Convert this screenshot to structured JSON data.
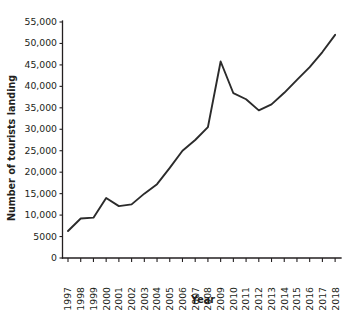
{
  "chart_data": {
    "type": "line",
    "title": "",
    "xlabel": "Year",
    "ylabel": "Number of tourists landing",
    "categories": [
      "1997",
      "1998",
      "1999",
      "2000",
      "2001",
      "2002",
      "2003",
      "2004",
      "2005",
      "2006",
      "2007",
      "2008",
      "2009",
      "2010",
      "2011",
      "2012",
      "2013",
      "2014",
      "2015",
      "2016",
      "2017",
      "2018"
    ],
    "values": [
      6300,
      9200,
      9400,
      14000,
      12100,
      12500,
      15000,
      17200,
      21000,
      25000,
      27500,
      30500,
      45800,
      38400,
      37000,
      34400,
      35800,
      38500,
      41500,
      44500,
      48000,
      52000
    ],
    "series": [
      {
        "name": "Number of tourists landing",
        "values": [
          6300,
          9200,
          9400,
          14000,
          12100,
          12500,
          15000,
          17200,
          21000,
          25000,
          27500,
          30500,
          45800,
          38400,
          37000,
          34400,
          35800,
          38500,
          41500,
          44500,
          48000,
          52000
        ]
      }
    ],
    "ylim": [
      0,
      55000
    ],
    "ytick_values": [
      0,
      5000,
      10000,
      15000,
      20000,
      25000,
      30000,
      35000,
      40000,
      45000,
      50000,
      55000
    ],
    "ytick_labels": [
      "0",
      "5000",
      "10,000",
      "15,000",
      "20,000",
      "25,000",
      "30,000",
      "35,000",
      "40,000",
      "45,000",
      "50,000",
      "55,000"
    ],
    "grid": false,
    "legend": "none",
    "line_color": "#2b2b2b",
    "axis_color": "#231f20",
    "background_color": "#ffffff",
    "xtick_rotation": 90
  }
}
